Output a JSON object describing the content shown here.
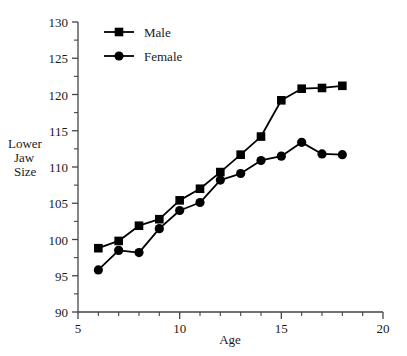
{
  "chart_data": {
    "type": "line",
    "title": "",
    "xlabel": "Age",
    "ylabel": "Lower Jaw Size",
    "ylabel_lines": [
      "Lower",
      "Jaw",
      "Size"
    ],
    "xlim": [
      5,
      20
    ],
    "ylim": [
      90,
      130
    ],
    "x_major_ticks": [
      5,
      10,
      15,
      20
    ],
    "x_major_tick_labels": [
      "5",
      "10",
      "15",
      "20"
    ],
    "x_minor_ticks": [
      6,
      7,
      8,
      9,
      11,
      12,
      13,
      14,
      16,
      17,
      18,
      19
    ],
    "y_major_ticks": [
      90,
      95,
      100,
      105,
      110,
      115,
      120,
      125,
      130
    ],
    "y_major_tick_labels": [
      "90",
      "95",
      "100",
      "105",
      "110",
      "115",
      "120",
      "125",
      "130"
    ],
    "y_minor_ticks": [
      92.5,
      97.5,
      102.5,
      107.5,
      112.5,
      117.5,
      122.5,
      127.5
    ],
    "grid": false,
    "legend_position": "top-left",
    "x": [
      6,
      7,
      8,
      9,
      10,
      11,
      12,
      13,
      14,
      15,
      16,
      17,
      18
    ],
    "series": [
      {
        "name": "Male",
        "marker": "square",
        "color": "#000000",
        "values": [
          98.8,
          99.8,
          101.9,
          102.8,
          105.4,
          107.0,
          109.3,
          111.7,
          114.2,
          119.2,
          120.8,
          120.9,
          121.2
        ]
      },
      {
        "name": "Female",
        "marker": "circle",
        "color": "#000000",
        "values": [
          95.8,
          98.5,
          98.2,
          101.5,
          104.0,
          105.1,
          108.2,
          109.1,
          110.9,
          111.5,
          113.4,
          111.8,
          111.7
        ]
      }
    ]
  },
  "legend": {
    "items": [
      {
        "label": "Male",
        "marker": "square"
      },
      {
        "label": "Female",
        "marker": "circle"
      }
    ]
  },
  "axes": {
    "x_title": "Age",
    "y_title_lines": [
      "Lower",
      "Jaw",
      "Size"
    ]
  }
}
